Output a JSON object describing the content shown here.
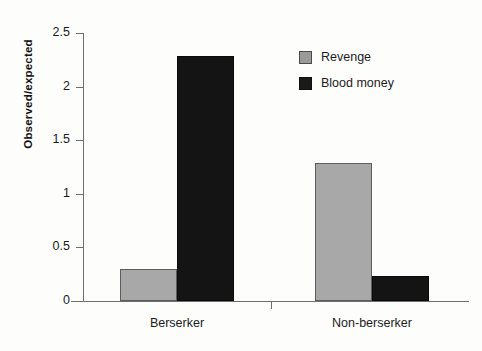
{
  "chart_data": {
    "type": "bar",
    "title": "",
    "subtitle": "",
    "xlabel": "",
    "ylabel": "Observed/expected",
    "ylim": [
      0,
      2.5
    ],
    "yticks": [
      0,
      0.5,
      1,
      1.5,
      2,
      2.5
    ],
    "ytick_labels": [
      "0",
      "0.5",
      "1",
      "1.5",
      "2",
      "2.5"
    ],
    "grid": false,
    "legend_position": "upper-center-right",
    "categories": [
      "Berserker",
      "Non-berserker"
    ],
    "series": [
      {
        "name": "Revenge",
        "color": "#a8a8a8",
        "values": [
          0.3,
          1.29
        ]
      },
      {
        "name": "Blood money",
        "color": "#141414",
        "values": [
          2.29,
          0.23
        ]
      }
    ]
  },
  "legend": {
    "items": [
      {
        "label": "Revenge",
        "swatch": "revenge-swatch"
      },
      {
        "label": "Blood money",
        "swatch": "blood-money-swatch"
      }
    ]
  },
  "axes": {
    "y_title": "Observed/expected"
  }
}
